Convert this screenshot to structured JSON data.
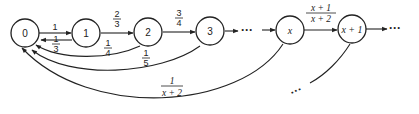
{
  "diagram": {
    "nodes": [
      {
        "id": "0",
        "label": "0"
      },
      {
        "id": "1",
        "label": "1"
      },
      {
        "id": "2",
        "label": "2"
      },
      {
        "id": "3",
        "label": "3"
      },
      {
        "id": "x",
        "label": "x"
      },
      {
        "id": "x+1",
        "label": "x + 1"
      }
    ],
    "forward_edges": [
      {
        "from": "0",
        "to": "1",
        "num": "1",
        "den": ""
      },
      {
        "from": "1",
        "to": "2",
        "num": "2",
        "den": "3"
      },
      {
        "from": "2",
        "to": "3",
        "num": "3",
        "den": "4"
      },
      {
        "from": "x",
        "to": "x+1",
        "num": "x + 1",
        "den": "x + 2"
      }
    ],
    "back_edges": [
      {
        "from": "1",
        "to": "0",
        "num": "1",
        "den": "3"
      },
      {
        "from": "2",
        "to": "0",
        "num": "1",
        "den": "4"
      },
      {
        "from": "3",
        "to": "0",
        "num": "1",
        "den": "5"
      },
      {
        "from": "x",
        "to": "0",
        "num": "1",
        "den": "x + 2"
      }
    ],
    "ellipsis": "···"
  }
}
